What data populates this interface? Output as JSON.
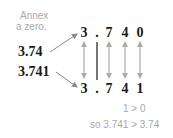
{
  "annotation": {
    "line1": "Annex",
    "line2": "a zero."
  },
  "left_numbers": {
    "first": "3.74",
    "second": "3.741"
  },
  "top_row": [
    "3",
    ".",
    "7",
    "4",
    "0"
  ],
  "bottom_row": [
    "3",
    ".",
    "7",
    "4",
    "1"
  ],
  "comparison": {
    "digit_compare": "1 > 0",
    "conclusion": "so 3.741 > 3.74"
  },
  "colors": {
    "arrow": "#999999",
    "text": "#1a1a1a",
    "note": "#a8a8a8"
  }
}
